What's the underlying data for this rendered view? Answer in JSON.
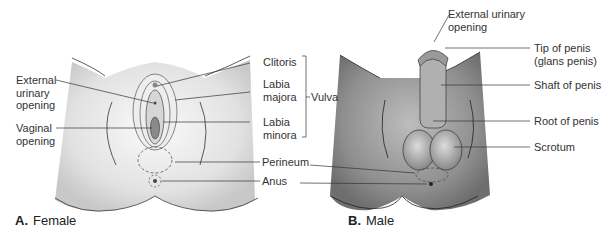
{
  "panels": [
    {
      "id": "A",
      "letter": "A.",
      "caption": "Female",
      "labels": {
        "external_urinary_opening": "External urinary opening",
        "eu_line1": "External",
        "eu_line2": "urinary",
        "eu_line3": "opening",
        "vaginal_line1": "Vaginal",
        "vaginal_line2": "opening",
        "clitoris": "Clitoris",
        "labia_majora_1": "Labia",
        "labia_majora_2": "majora",
        "labia_minora_1": "Labia",
        "labia_minora_2": "minora",
        "vulva": "Vulva",
        "perineum": "Perineum",
        "anus": "Anus"
      }
    },
    {
      "id": "B",
      "letter": "B.",
      "caption": "Male",
      "labels": {
        "eu_line1": "External urinary",
        "eu_line2": "opening",
        "tip_line1": "Tip of penis",
        "tip_line2": "(glans penis)",
        "shaft": "Shaft of penis",
        "root": "Root of penis",
        "scrotum": "Scrotum"
      }
    }
  ],
  "colors": {
    "female_skin": "#e6e6e6",
    "male_skin": "#9a9a9a",
    "line": "#333333"
  }
}
